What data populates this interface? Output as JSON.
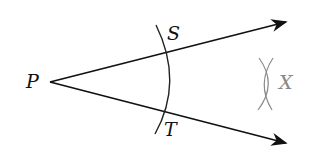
{
  "diagram": {
    "type": "angle-bisector-construction",
    "labels": {
      "vertex": "P",
      "upper_point": "S",
      "lower_point": "T",
      "bisector_point": "X"
    },
    "colors": {
      "main": "#111111",
      "construction": "#8a8a8a",
      "background": "#ffffff"
    }
  }
}
